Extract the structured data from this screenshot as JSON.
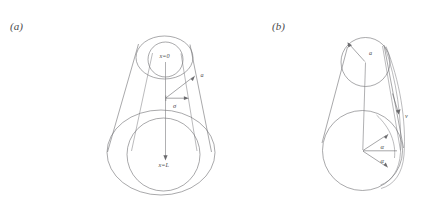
{
  "figure": {
    "background": "#ffffff",
    "line_color": "#6f6f72",
    "text_color": "#4a4a4d",
    "panels": [
      {
        "id": "a",
        "label": "(a)",
        "description": "Truncated cone viewed along its axis, with two concentric circles at each end and a radius/offset annotation.",
        "labels": {
          "top_axis": "x=0",
          "bottom_axis": "x=L",
          "radius": "a",
          "offset": "σ"
        }
      },
      {
        "id": "b",
        "label": "(b)",
        "description": "Cone with a lens-shaped sliver on its right flank, radius label, velocity arrow and two equal angles at the base centre.",
        "labels": {
          "radius": "a",
          "velocity": "v",
          "angle_upper": "α",
          "angle_lower": "α"
        }
      }
    ]
  }
}
